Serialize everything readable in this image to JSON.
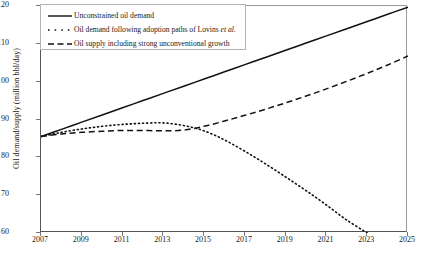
{
  "chart_data": {
    "type": "line",
    "title": "",
    "xlabel": "",
    "ylabel": "Oil demand/supply (million bbl/day)",
    "xlim": [
      2007,
      2025
    ],
    "ylim": [
      60,
      120
    ],
    "grid": false,
    "legend_position": "top-left",
    "xticks": [
      "2007",
      "2009",
      "2011",
      "2013",
      "2015",
      "2017",
      "2019",
      "2021",
      "2023",
      "2025"
    ],
    "xtick_values": [
      2007,
      2009,
      2011,
      2013,
      2015,
      2017,
      2019,
      2021,
      2023,
      2025
    ],
    "yticks": [
      "60",
      "70",
      "80",
      "90",
      "100",
      "110",
      "120"
    ],
    "ytick_values": [
      60,
      70,
      80,
      90,
      100,
      110,
      120
    ],
    "x": [
      2007,
      2008,
      2009,
      2010,
      2011,
      2012,
      2013,
      2014,
      2015,
      2016,
      2017,
      2018,
      2019,
      2020,
      2021,
      2022,
      2023,
      2024,
      2025
    ],
    "series": [
      {
        "name": "Unconstrained oil demand",
        "style": "solid",
        "color": "#111111",
        "clipped_at_top": true,
        "values": [
          85.5,
          87.4,
          89.3,
          91.2,
          93.1,
          95.0,
          96.9,
          98.8,
          100.7,
          102.6,
          104.5,
          106.4,
          108.3,
          110.2,
          112.1,
          114.0,
          115.9,
          117.8,
          119.7
        ]
      },
      {
        "name": "Oil demand following adoption paths of Lovins et al.",
        "style": "dotted",
        "color": "#111111",
        "values": [
          85.5,
          86.6,
          87.5,
          88.2,
          88.7,
          89.0,
          89.1,
          88.4,
          87.0,
          84.6,
          81.6,
          78.3,
          74.8,
          71.2,
          67.4,
          63.4,
          60.0,
          null,
          null
        ]
      },
      {
        "name": "Oil supply including strong unconventional growth",
        "style": "dashed",
        "color": "#111111",
        "values": [
          85.5,
          86.2,
          86.6,
          86.9,
          87.1,
          87.1,
          87.0,
          87.2,
          88.2,
          89.6,
          91.1,
          92.7,
          94.4,
          96.2,
          98.1,
          100.1,
          102.2,
          104.4,
          106.8
        ]
      }
    ]
  },
  "legend": {
    "entries": [
      {
        "label": "Unconstrained oil demand",
        "style": "solid"
      },
      {
        "label_pre": "Oil demand following adoption paths of Lovins ",
        "label_italic": "et al.",
        "style": "dotted"
      },
      {
        "label": "Oil supply including strong unconventional growth",
        "style": "dashed"
      }
    ]
  }
}
